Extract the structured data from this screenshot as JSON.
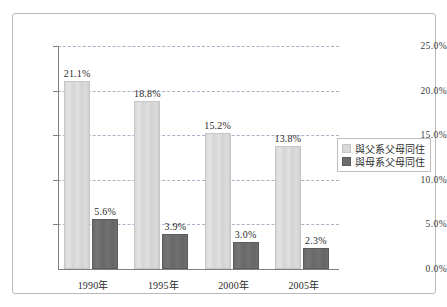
{
  "chart_data": {
    "type": "bar",
    "title": "",
    "xlabel": "",
    "ylabel": "",
    "categories": [
      "1990年",
      "1995年",
      "2000年",
      "2005年"
    ],
    "series": [
      {
        "name": "與父系父母同住",
        "color": "#d8d8d8",
        "values": [
          21.1,
          18.8,
          15.2,
          13.8
        ],
        "labels": [
          "21.1%",
          "18.8%",
          "15.2%",
          "13.8%"
        ]
      },
      {
        "name": "與母系父母同住",
        "color": "#6c6c6c",
        "values": [
          5.6,
          3.9,
          3.0,
          2.3
        ],
        "labels": [
          "5.6%",
          "3.9%",
          "3.0%",
          "2.3%"
        ]
      }
    ],
    "ylim": [
      0,
      25
    ],
    "ytick_values": [
      0,
      5,
      10,
      15,
      20,
      25
    ],
    "ytick_labels": [
      "0.0%",
      "5.0%",
      "10.0%",
      "15.0%",
      "20.0%",
      "25.0%"
    ],
    "grid": true,
    "grid_style": "dashed",
    "grid_color": "#9aa7bb",
    "legend_position": "right"
  }
}
